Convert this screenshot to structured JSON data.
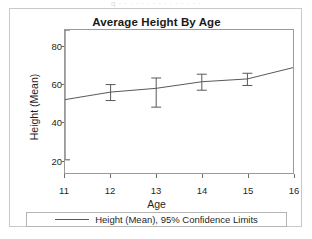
{
  "scan": {
    "top_strip_text": "g        ·  ·  ·  ·  ·  ·  ·  ·  ·  ·  ·  ·  ·  ·  ·"
  },
  "chart": {
    "title": "Average Height By Age",
    "x_axis_title": "Age",
    "y_axis_title": "Height (Mean)",
    "legend": {
      "swatch_name": "line-swatch",
      "label": "Height (Mean), 95% Confidence Limits"
    }
  },
  "colors": {
    "line": "#595959",
    "frame": "#9a9a9a",
    "card_border": "#c9c9c9",
    "text": "#1f1f1f",
    "background": "#ffffff"
  },
  "chart_data": {
    "type": "line",
    "title": "Average Height By Age",
    "xlabel": "Age",
    "ylabel": "Height (Mean)",
    "xlim": [
      11,
      16
    ],
    "ylim": [
      13,
      89
    ],
    "xticks": [
      11,
      12,
      13,
      14,
      15,
      16
    ],
    "yticks": [
      20,
      40,
      60,
      80
    ],
    "grid": false,
    "legend_position": "bottom",
    "error_bars": "95% Confidence Limits",
    "x": [
      11,
      12,
      13,
      14,
      15,
      16
    ],
    "series": [
      {
        "name": "Height (Mean), 95% Confidence Limits",
        "values": [
          52.0,
          56.0,
          58.0,
          61.5,
          63.0,
          69.0
        ],
        "ci_lower": [
          20.0,
          51.5,
          48.0,
          57.0,
          59.5,
          null
        ],
        "ci_upper": [
          89.0,
          60.0,
          63.5,
          65.5,
          66.0,
          null
        ]
      }
    ]
  }
}
